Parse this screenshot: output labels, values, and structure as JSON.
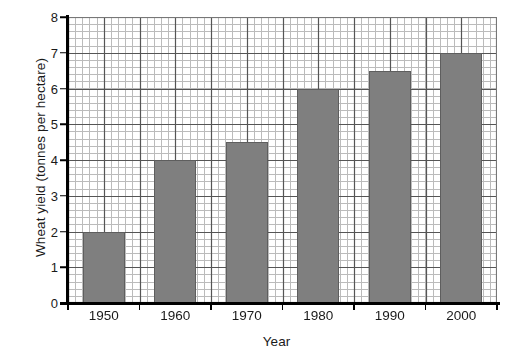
{
  "chart_data": {
    "type": "bar",
    "title": "",
    "xlabel": "Year",
    "ylabel": "Wheat yield (tonnes per hectare)",
    "categories": [
      "1950",
      "1960",
      "1970",
      "1980",
      "1990",
      "2000"
    ],
    "values": [
      2.0,
      4.0,
      4.5,
      6.0,
      6.5,
      7.0
    ],
    "ylim": [
      0,
      8
    ],
    "xlim_note": "categorical, 6 year groups",
    "ytick_labels": [
      "0",
      "1",
      "2",
      "3",
      "4",
      "5",
      "6",
      "7",
      "8"
    ],
    "ytick_values": [
      0,
      1,
      2,
      3,
      4,
      5,
      6,
      7,
      8
    ],
    "grid": "graph-paper: minor gridlines every 0.2 units, major gridlines every 1 unit",
    "legend": "none",
    "bar_color": "#7f7f7f",
    "bar_edge_color": "#5e5e5e",
    "grid_major_color": "#555555",
    "grid_minor_color": "#bbbbbb",
    "axis_color": "#000000",
    "background_color": "#ffffff"
  },
  "axes": {
    "y_title": "Wheat yield (tonnes per hectare)",
    "x_title": "Year"
  }
}
